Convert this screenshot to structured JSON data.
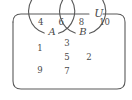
{
  "figure": {
    "type": "venn-diagram",
    "universe_label": "U",
    "set_labels": {
      "left": "A",
      "right": "B"
    },
    "colors": {
      "stroke": "#595959",
      "text": "#4a4a4a",
      "background": "#ffffff"
    }
  },
  "regions": {
    "outside_both": {
      "name": "universe-only",
      "elements": [
        "4",
        "6",
        "8",
        "10"
      ]
    },
    "left_only": {
      "name": "A-only",
      "elements": [
        "1",
        "9"
      ]
    },
    "intersection": {
      "name": "A-intersect-B",
      "elements": [
        "3",
        "5",
        "7"
      ]
    },
    "right_only": {
      "name": "B-only",
      "elements": [
        "2"
      ]
    }
  }
}
